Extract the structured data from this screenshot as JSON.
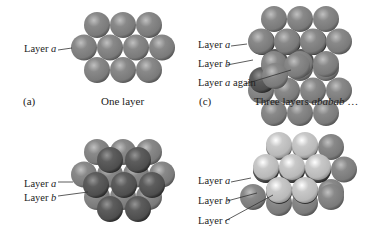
{
  "figure": {
    "panels": [
      {
        "id": "a",
        "tag": "(a)",
        "caption": "One layer",
        "labels": [
          {
            "text": "Layer ",
            "var": "a",
            "suffix": ""
          }
        ]
      },
      {
        "id": "c",
        "tag": "(c)",
        "caption_prefix": "Three layers ",
        "caption_italic": "ababab",
        "caption_suffix": " …",
        "labels": [
          {
            "text": "Layer ",
            "var": "a",
            "suffix": ""
          },
          {
            "text": "Layer ",
            "var": "b",
            "suffix": ""
          },
          {
            "text": "Layer ",
            "var": "a",
            "suffix": " again"
          }
        ]
      },
      {
        "id": "b",
        "labels": [
          {
            "text": "Layer ",
            "var": "a",
            "suffix": ""
          },
          {
            "text": "Layer ",
            "var": "b",
            "suffix": ""
          }
        ]
      },
      {
        "id": "d",
        "labels": [
          {
            "text": "Layer ",
            "var": "a",
            "suffix": ""
          },
          {
            "text": "Layer ",
            "var": "b",
            "suffix": ""
          },
          {
            "text": "Layer ",
            "var": "c",
            "suffix": ""
          }
        ]
      }
    ],
    "colors": {
      "layer_a": "#7a7a7a",
      "layer_b": "#4e4e4e",
      "layer_c": "#b9b9b9",
      "leader_line": "#333333"
    }
  }
}
